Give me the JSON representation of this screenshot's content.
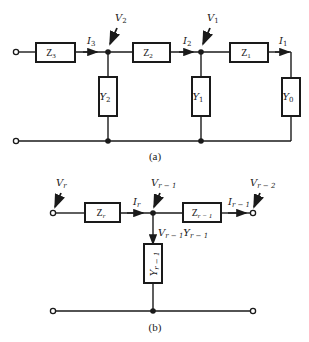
{
  "figure_a": {
    "caption": "(a)",
    "impedances": [
      {
        "id": "Z3",
        "label": "Z",
        "sub": "3"
      },
      {
        "id": "Z2",
        "label": "Z",
        "sub": "2"
      },
      {
        "id": "Z1",
        "label": "Z",
        "sub": "1"
      }
    ],
    "admittances": [
      {
        "id": "Y2",
        "label": "Y",
        "sub": "2"
      },
      {
        "id": "Y1",
        "label": "Y",
        "sub": "1"
      },
      {
        "id": "Y0",
        "label": "Y",
        "sub": "0"
      }
    ],
    "currents": [
      {
        "id": "I3",
        "label": "I",
        "sub": "3"
      },
      {
        "id": "I2",
        "label": "I",
        "sub": "2"
      },
      {
        "id": "I1",
        "label": "I",
        "sub": "1"
      }
    ],
    "voltages": [
      {
        "id": "V2",
        "label": "V",
        "sub": "2"
      },
      {
        "id": "V1",
        "label": "V",
        "sub": "1"
      }
    ]
  },
  "figure_b": {
    "caption": "(b)",
    "impedances": [
      {
        "id": "Zr",
        "label": "Z",
        "sub": "r"
      },
      {
        "id": "Zr-1",
        "label": "Z",
        "sub": "r − 1"
      }
    ],
    "admittances": [
      {
        "id": "Yr-1",
        "label": "Y",
        "sub": "r − 1"
      }
    ],
    "currents": [
      {
        "id": "Ir",
        "label": "I",
        "sub": "r"
      },
      {
        "id": "Ir-1",
        "label": "I",
        "sub": "r − 1"
      }
    ],
    "voltages": [
      {
        "id": "Vr",
        "label": "V",
        "sub": "r"
      },
      {
        "id": "Vr-1",
        "label": "V",
        "sub": "r − 1"
      },
      {
        "id": "Vr-2",
        "label": "V",
        "sub": "r − 2"
      }
    ],
    "branch_current": {
      "v": "V",
      "v_sub": "r − 1",
      "y": "Y",
      "y_sub": "r − 1"
    }
  }
}
